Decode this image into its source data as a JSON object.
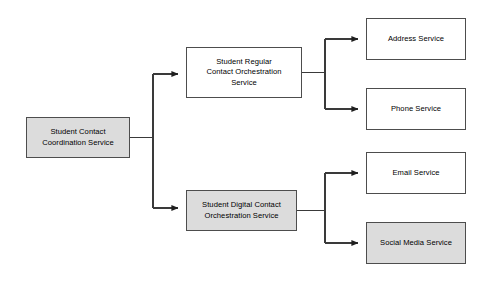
{
  "diagram": {
    "type": "flowchart",
    "canvas": {
      "width": 494,
      "height": 282,
      "background": "#ffffff"
    },
    "colors": {
      "node_fill_gray": "#dcdcdc",
      "node_fill_white": "#ffffff",
      "node_border": "#4d4d4d",
      "connector": "#3a3a3a",
      "text": "#000000"
    },
    "nodes": [
      {
        "id": "student-contact-coordination-service",
        "label": "Student Contact\nCoordination Service",
        "fill": "gray",
        "x": 26,
        "y": 117,
        "w": 104,
        "h": 41
      },
      {
        "id": "student-regular-contact-orchestration-service",
        "label": "Student Regular\nContact Orchestration\nService",
        "fill": "white",
        "x": 186,
        "y": 47,
        "w": 116,
        "h": 51
      },
      {
        "id": "student-digital-contact-orchestration-service",
        "label": "Student Digital Contact\nOrchestration Service",
        "fill": "gray",
        "x": 186,
        "y": 190,
        "w": 111,
        "h": 41
      },
      {
        "id": "address-service",
        "label": "Address Service",
        "fill": "white",
        "x": 366,
        "y": 18,
        "w": 100,
        "h": 42
      },
      {
        "id": "phone-service",
        "label": "Phone Service",
        "fill": "white",
        "x": 366,
        "y": 88,
        "w": 100,
        "h": 42
      },
      {
        "id": "email-service",
        "label": "Email Service",
        "fill": "white",
        "x": 366,
        "y": 152,
        "w": 100,
        "h": 42
      },
      {
        "id": "social-media-service",
        "label": "Social Media Service",
        "fill": "gray",
        "x": 366,
        "y": 222,
        "w": 100,
        "h": 42
      }
    ],
    "edges": [
      {
        "id": "coordination-to-regular",
        "from": "student-contact-coordination-service",
        "to": "student-regular-contact-orchestration-service",
        "arrow": true
      },
      {
        "id": "coordination-to-digital",
        "from": "student-contact-coordination-service",
        "to": "student-digital-contact-orchestration-service",
        "arrow": true
      },
      {
        "id": "regular-to-address",
        "from": "student-regular-contact-orchestration-service",
        "to": "address-service",
        "arrow": true
      },
      {
        "id": "regular-to-phone",
        "from": "student-regular-contact-orchestration-service",
        "to": "phone-service",
        "arrow": true
      },
      {
        "id": "digital-to-email",
        "from": "student-digital-contact-orchestration-service",
        "to": "email-service",
        "arrow": true
      },
      {
        "id": "digital-to-social-media",
        "from": "student-digital-contact-orchestration-service",
        "to": "social-media-service",
        "arrow": true
      }
    ]
  }
}
